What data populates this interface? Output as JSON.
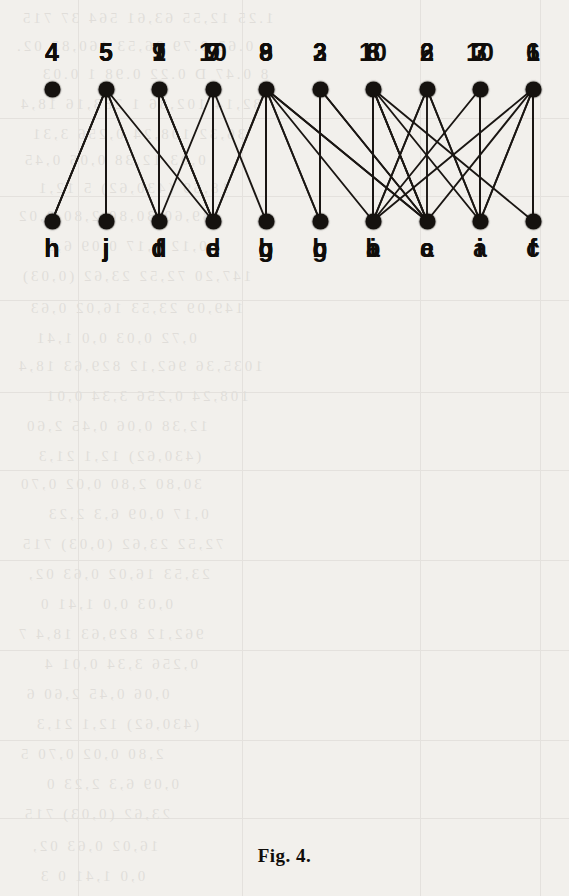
{
  "figure": {
    "caption": "Fig. 4.",
    "node_color": "#15120f",
    "edge_color": "#1a1613",
    "background_color": "#f2f0ec"
  },
  "geometry": {
    "node_xs": [
      52,
      106,
      159,
      213,
      266,
      320,
      373,
      427,
      480,
      533
    ],
    "panel_tops": [
      30,
      300,
      570
    ],
    "top_label_y": 58,
    "top_node_y": 89,
    "bottom_node_y": 221,
    "bottom_label_y": 252,
    "caption_y": 845
  },
  "panels": [
    {
      "name": "diagram-1",
      "top_labels": [
        "4",
        "5",
        "1",
        "10",
        "9",
        "3",
        "8",
        "2",
        "7",
        "6"
      ],
      "bottom_labels": [
        "h",
        "j",
        "f",
        "d",
        "b",
        "g",
        "a",
        "e",
        "i",
        "c"
      ],
      "edges": [
        [
          1,
          0
        ],
        [
          1,
          1
        ],
        [
          1,
          3
        ],
        [
          2,
          2
        ],
        [
          2,
          3
        ],
        [
          3,
          4
        ],
        [
          4,
          4
        ],
        [
          4,
          6
        ],
        [
          5,
          5
        ],
        [
          5,
          7
        ],
        [
          6,
          6
        ],
        [
          6,
          7
        ],
        [
          6,
          9
        ],
        [
          7,
          6
        ],
        [
          7,
          8
        ],
        [
          8,
          6
        ],
        [
          9,
          6
        ],
        [
          9,
          8
        ],
        [
          9,
          9
        ]
      ]
    },
    {
      "name": "diagram-2",
      "top_labels": [
        "4",
        "5",
        "7",
        "9",
        "8",
        "2",
        "10",
        "6",
        "3",
        "1"
      ],
      "bottom_labels": [
        "h",
        "j",
        "d",
        "e",
        "g",
        "c",
        "b",
        "a",
        "i",
        "f"
      ],
      "edges": [
        [
          1,
          0
        ],
        [
          1,
          1
        ],
        [
          1,
          2
        ],
        [
          2,
          3
        ],
        [
          3,
          2
        ],
        [
          3,
          3
        ],
        [
          4,
          3
        ],
        [
          4,
          4
        ],
        [
          4,
          5
        ],
        [
          4,
          7
        ],
        [
          5,
          5
        ],
        [
          5,
          7
        ],
        [
          6,
          7
        ],
        [
          7,
          6
        ],
        [
          7,
          7
        ],
        [
          8,
          8
        ],
        [
          9,
          7
        ],
        [
          9,
          9
        ]
      ]
    },
    {
      "name": "diagram-3",
      "top_labels": [
        "4",
        "5",
        "9",
        "7",
        "8",
        "3",
        "6",
        "2",
        "10",
        "1"
      ],
      "bottom_labels": [
        "h",
        "j",
        "d",
        "e",
        "g",
        "b",
        "i",
        "c",
        "a",
        "f"
      ],
      "edges": [
        [
          1,
          0
        ],
        [
          1,
          1
        ],
        [
          1,
          2
        ],
        [
          2,
          2
        ],
        [
          2,
          3
        ],
        [
          3,
          3
        ],
        [
          4,
          3
        ],
        [
          4,
          4
        ],
        [
          4,
          5
        ],
        [
          4,
          7
        ],
        [
          5,
          5
        ],
        [
          6,
          6
        ],
        [
          6,
          7
        ],
        [
          6,
          8
        ],
        [
          7,
          8
        ],
        [
          8,
          8
        ],
        [
          9,
          8
        ],
        [
          9,
          9
        ]
      ]
    }
  ],
  "bleed_text": {
    "lines": [
      {
        "top": 10,
        "left": 20,
        "text": "1.25  12,55  63,61  564 37   715"
      },
      {
        "top": 38,
        "left": 14,
        "text": "0.63   0.79  36,53  160,83  02."
      },
      {
        "top": 66,
        "left": 40,
        "text": "8 0.47  D 0.22   0.98   1 0.03"
      },
      {
        "top": 96,
        "left": 18,
        "text": "82,14  102,86   1 283,16   18,4"
      },
      {
        "top": 126,
        "left": 30,
        "text": "36,32  108,24   0,256  3,31"
      },
      {
        "top": 152,
        "left": 22,
        "text": "0,03   12,38   0,06   0,45"
      },
      {
        "top": 180,
        "left": 36,
        "text": "18,69  (430,62)  5 12,1"
      },
      {
        "top": 208,
        "left": 16,
        "text": "39,60   30,80   2,80   0,02"
      },
      {
        "top": 238,
        "left": 44,
        "text": "0,12    0,17    0,09    6,3"
      },
      {
        "top": 268,
        "left": 20,
        "text": "147,20  72,52  23,62  (0,03)"
      },
      {
        "top": 300,
        "left": 28,
        "text": "149,09  23,53  16,02  0,63"
      },
      {
        "top": 330,
        "left": 34,
        "text": "0,72   0,03   0,0   1,41"
      },
      {
        "top": 358,
        "left": 16,
        "text": "1035,36  962,12  829,63  18,4"
      },
      {
        "top": 388,
        "left": 44,
        "text": "108,24  0,256  3,34  0,01"
      },
      {
        "top": 418,
        "left": 24,
        "text": "12,38   0,06   0,45   2,60"
      },
      {
        "top": 448,
        "left": 36,
        "text": "(430,62)  12,1   21,3"
      },
      {
        "top": 476,
        "left": 18,
        "text": "30,80   2,80   0,02   0,70"
      },
      {
        "top": 506,
        "left": 46,
        "text": "0,17   0,09   6,3   2,23"
      },
      {
        "top": 536,
        "left": 20,
        "text": "72,52  23,62  (0,03)  715"
      },
      {
        "top": 566,
        "left": 26,
        "text": "23,53  16,02  0,63  02,"
      },
      {
        "top": 596,
        "left": 38,
        "text": "0,03   0,0   1,41   0"
      },
      {
        "top": 626,
        "left": 16,
        "text": "962,12  829,63  18,4  7"
      },
      {
        "top": 656,
        "left": 42,
        "text": "0,256  3,34  0,01  4"
      },
      {
        "top": 686,
        "left": 24,
        "text": "0,06   0,45   2,60   6"
      },
      {
        "top": 716,
        "left": 34,
        "text": "(430,62)  12,1  21,3"
      },
      {
        "top": 746,
        "left": 18,
        "text": "2,80   0,02   0,70   5"
      },
      {
        "top": 776,
        "left": 44,
        "text": "0,09   6,3   2,23   0"
      },
      {
        "top": 806,
        "left": 22,
        "text": "23,62   (0,03)   715"
      },
      {
        "top": 838,
        "left": 30,
        "text": "16,02   0,63   02,"
      },
      {
        "top": 868,
        "left": 38,
        "text": "0,0   1,41   0   3"
      }
    ],
    "vlines": [
      78,
      242,
      420,
      540
    ],
    "hlines": [
      118,
      196,
      300,
      392,
      470,
      560,
      650,
      740,
      818
    ]
  }
}
